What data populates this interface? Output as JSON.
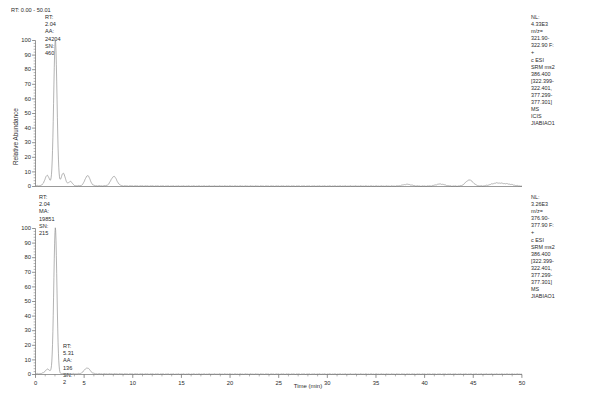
{
  "header": {
    "range_label": "RT: 0.00 - 50.01"
  },
  "axis": {
    "y_title": "Relative Abundance",
    "x_title": "Time (min)",
    "y_ticks": [
      "100",
      "90",
      "80",
      "70",
      "60",
      "50",
      "40",
      "30",
      "20",
      "10",
      "0"
    ],
    "x_ticks": [
      "0",
      "5",
      "10",
      "15",
      "20",
      "25",
      "30",
      "35",
      "40",
      "45",
      "50"
    ]
  },
  "panels": [
    {
      "id": "panel-top",
      "peak_label": "RT: 2.04\nAA: 24204\nSN: 460",
      "peak_rt": "2.04",
      "peak_area": "24204",
      "peak_sn": "460",
      "annotation": "NL: 4.33E3\nm/z= 321.90-322.90 F: +\nc ESI SRM ms2 386.400\n[322.399-322.401,\n377.299-377.301]  MS\nICIS JIABIAO1",
      "nl": "NL: 4.33E3",
      "mz": "m/z= 321.90-322.90 F: +",
      "scan": "c ESI SRM ms2 386.400",
      "window1": "[322.399-322.401,",
      "window2": "377.299-377.301]  MS",
      "sample": "ICIS JIABIAO1"
    },
    {
      "id": "panel-bottom",
      "peak_label": "RT: 2.04\nMA: 19851\nSN: 215",
      "peak_rt": "2.04",
      "peak_area": "19851",
      "peak_sn": "215",
      "peak_label2": "RT: 5.31\nAA: 136\nSN: 2",
      "peak2_rt": "5.31",
      "peak2_area": "136",
      "peak2_sn": "2",
      "annotation": "NL: 3.26E3\nm/z= 376.90-377.90 F: +\nc ESI SRM ms2 386.400\n[322.399-322.401,\n377.299-377.301]  MS\nJIABIAO1",
      "nl": "NL: 3.26E3",
      "mz": "m/z= 376.90-377.90 F: +",
      "scan": "c ESI SRM ms2 386.400",
      "window1": "[322.399-322.401,",
      "window2": "377.299-377.301]  MS",
      "sample": "JIABIAO1"
    }
  ],
  "chart_data": {
    "type": "line",
    "title": "RT: 0.00 - 50.01",
    "xlabel": "Time (min)",
    "ylabel": "Relative Abundance",
    "xlim": [
      0,
      50.01
    ],
    "ylim": [
      0,
      100
    ],
    "grid": false,
    "series": [
      {
        "name": "m/z= 321.90-322.90 F: + c ESI SRM ms2 386.400 [322.399-322.401, 377.299-377.301] MS ICIS JIABIAO1",
        "nl": "4.33E3",
        "panel": "top",
        "peaks": [
          {
            "rt": 1.2,
            "height": 7.0,
            "width": 0.24
          },
          {
            "rt": 2.04,
            "height": 100.0,
            "width": 0.17
          },
          {
            "rt": 2.85,
            "height": 8.5,
            "width": 0.22
          },
          {
            "rt": 3.6,
            "height": 3.0,
            "width": 0.18
          },
          {
            "rt": 5.35,
            "height": 7.0,
            "width": 0.26
          },
          {
            "rt": 8.05,
            "height": 6.5,
            "width": 0.3
          },
          {
            "rt": 38.2,
            "height": 1.2,
            "width": 0.45
          },
          {
            "rt": 41.6,
            "height": 1.4,
            "width": 0.45
          },
          {
            "rt": 44.6,
            "height": 4.2,
            "width": 0.38
          },
          {
            "rt": 47.4,
            "height": 2.0,
            "width": 0.6
          },
          {
            "rt": 48.6,
            "height": 1.2,
            "width": 0.55
          }
        ],
        "labeled_peak": {
          "rt": 2.04,
          "area": 24204,
          "sn": 460
        }
      },
      {
        "name": "m/z= 376.90-377.90 F: + c ESI SRM ms2 386.400 [322.399-322.401, 377.299-377.301] MS JIABIAO1",
        "nl": "3.26E3",
        "panel": "bottom",
        "peaks": [
          {
            "rt": 1.25,
            "height": 3.0,
            "width": 0.26
          },
          {
            "rt": 2.04,
            "height": 100.0,
            "width": 0.16
          },
          {
            "rt": 5.31,
            "height": 4.0,
            "width": 0.3
          }
        ],
        "labeled_peak": {
          "rt": 2.04,
          "area": 19851,
          "sn": 215
        },
        "labeled_peak2": {
          "rt": 5.31,
          "area": 136,
          "sn": 2
        }
      }
    ]
  }
}
